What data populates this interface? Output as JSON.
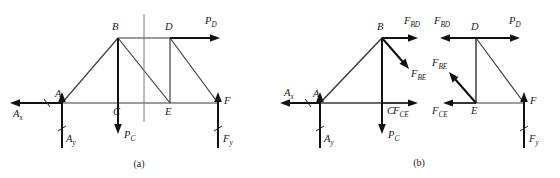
{
  "figure": {
    "captions": [
      {
        "id": "caption-a",
        "text": "(a)",
        "x": 139,
        "y": 167
      },
      {
        "id": "caption-b",
        "text": "(b)",
        "x": 419,
        "y": 166
      }
    ],
    "colors": {
      "member": "#3a3a3a",
      "cut_line": "#777777",
      "force_arrow": "#111111",
      "text": "#1a1a1a",
      "background": "#ffffff"
    }
  },
  "panel_a": {
    "name": "whole-truss-free-body",
    "nodes": [
      {
        "id": "A",
        "label": "A",
        "x": 62,
        "y": 103,
        "label_x": 55,
        "label_y": 97
      },
      {
        "id": "B",
        "label": "B",
        "x": 118,
        "y": 38,
        "label_x": 112,
        "label_y": 30
      },
      {
        "id": "C",
        "label": "C",
        "x": 118,
        "y": 103,
        "label_x": 113,
        "label_y": 115
      },
      {
        "id": "D",
        "label": "D",
        "x": 170,
        "y": 38,
        "label_x": 165,
        "label_y": 30
      },
      {
        "id": "E",
        "label": "E",
        "x": 170,
        "y": 103,
        "label_x": 165,
        "label_y": 115
      },
      {
        "id": "F",
        "label": "F",
        "x": 218,
        "y": 103,
        "label_x": 224,
        "label_y": 104
      }
    ],
    "members": [
      {
        "from": "A",
        "to": "B"
      },
      {
        "from": "B",
        "to": "D"
      },
      {
        "from": "D",
        "to": "F"
      },
      {
        "from": "A",
        "to": "F"
      },
      {
        "from": "B",
        "to": "C"
      },
      {
        "from": "B",
        "to": "E"
      },
      {
        "from": "D",
        "to": "E"
      }
    ],
    "cut_line": {
      "x": 144,
      "y1": 14,
      "y2": 122
    },
    "forces": [
      {
        "id": "Ax",
        "base": "A",
        "letter": "A",
        "sub": "x",
        "dir": "left",
        "label_x": 13,
        "label_y": 117
      },
      {
        "id": "Ay",
        "base": "A",
        "letter": "A",
        "sub": "y",
        "dir": "up",
        "label_x": 66,
        "label_y": 142
      },
      {
        "id": "PC",
        "base": "C",
        "letter": "P",
        "sub": "C",
        "dir": "down",
        "label_x": 124,
        "label_y": 138
      },
      {
        "id": "PD",
        "base": "D",
        "letter": "P",
        "sub": "D",
        "dir": "right",
        "label_x": 205,
        "label_y": 24
      },
      {
        "id": "Fy",
        "base": "F",
        "letter": "F",
        "sub": "y",
        "dir": "up",
        "label_x": 223,
        "label_y": 142
      }
    ]
  },
  "panel_b_left": {
    "name": "left-section-free-body",
    "nodes": [
      {
        "id": "A",
        "label": "A",
        "x": 320,
        "y": 103,
        "label_x": 313,
        "label_y": 97
      },
      {
        "id": "B",
        "label": "B",
        "x": 382,
        "y": 38,
        "label_x": 377,
        "label_y": 30
      },
      {
        "id": "C",
        "label": "C",
        "x": 382,
        "y": 103,
        "label_x": 387,
        "label_y": 114
      }
    ],
    "members": [
      {
        "from": "A",
        "to": "B"
      },
      {
        "from": "B",
        "to": "C"
      },
      {
        "from": "A",
        "to": "C"
      }
    ],
    "forces": [
      {
        "id": "Ax",
        "letter": "A",
        "sub": "x",
        "dir": "left",
        "label_x": 284,
        "label_y": 96
      },
      {
        "id": "Ay",
        "letter": "A",
        "sub": "y",
        "dir": "up",
        "label_x": 324,
        "label_y": 142
      },
      {
        "id": "PC",
        "letter": "P",
        "sub": "C",
        "dir": "down",
        "label_x": 388,
        "label_y": 138
      },
      {
        "id": "FBD",
        "letter": "F",
        "sub": "BD",
        "dir": "right",
        "label_x": 404,
        "label_y": 24
      },
      {
        "id": "FBE",
        "letter": "F",
        "sub": "BE",
        "dir": "down-right",
        "label_x": 411,
        "label_y": 77
      },
      {
        "id": "FCE",
        "letter": "F",
        "sub": "CE",
        "dir": "right",
        "label_x": 393,
        "label_y": 114
      }
    ]
  },
  "panel_b_right": {
    "name": "right-section-free-body",
    "nodes": [
      {
        "id": "D",
        "label": "D",
        "x": 476,
        "y": 38,
        "label_x": 471,
        "label_y": 30
      },
      {
        "id": "E",
        "label": "E",
        "x": 476,
        "y": 103,
        "label_x": 471,
        "label_y": 114
      },
      {
        "id": "F",
        "label": "F",
        "x": 524,
        "y": 103,
        "label_x": 530,
        "label_y": 104
      }
    ],
    "members": [
      {
        "from": "D",
        "to": "E"
      },
      {
        "from": "D",
        "to": "F"
      },
      {
        "from": "E",
        "to": "F"
      }
    ],
    "forces": [
      {
        "id": "FBD",
        "letter": "F",
        "sub": "BD",
        "dir": "left",
        "label_x": 434,
        "label_y": 24
      },
      {
        "id": "PD",
        "letter": "P",
        "sub": "D",
        "dir": "right",
        "label_x": 509,
        "label_y": 24
      },
      {
        "id": "FBE",
        "letter": "F",
        "sub": "BE",
        "dir": "up-left",
        "label_x": 432,
        "label_y": 66
      },
      {
        "id": "FCE",
        "letter": "F",
        "sub": "CE",
        "dir": "left",
        "label_x": 432,
        "label_y": 114
      },
      {
        "id": "Fy",
        "letter": "F",
        "sub": "y",
        "dir": "up",
        "label_x": 529,
        "label_y": 142
      }
    ]
  }
}
